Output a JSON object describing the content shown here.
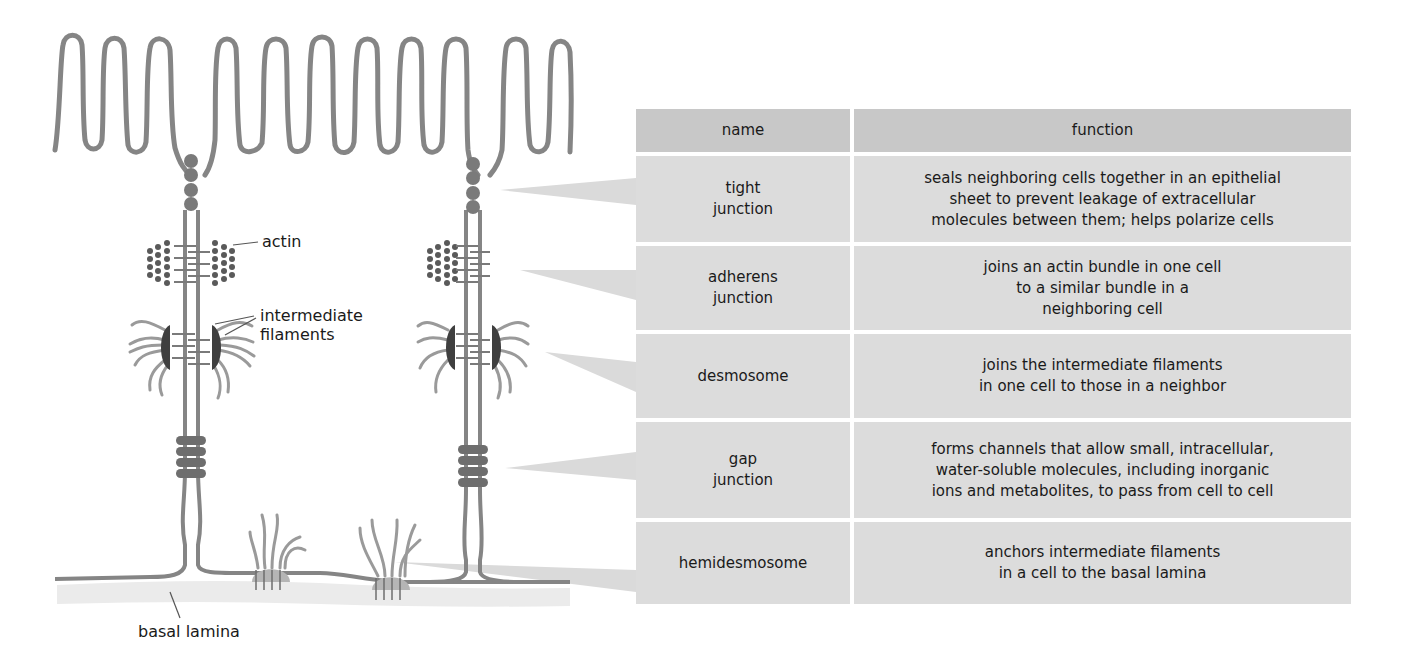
{
  "diagram": {
    "labels": {
      "actin": "actin",
      "intermediate_filaments": "intermediate\nfilaments",
      "basal_lamina": "basal lamina"
    },
    "colors": {
      "membrane": "#858585",
      "junction_dark": "#6e6e6e",
      "plaque": "#3e3e3e",
      "filament": "#9a9a9a",
      "basal_lamina": "#ececec",
      "pointer": "#d9d9d9"
    }
  },
  "table": {
    "headers": {
      "name": "name",
      "function": "function"
    },
    "rows": [
      {
        "name": "tight\njunction",
        "function": "seals neighboring cells together in an epithelial\nsheet to prevent leakage of extracellular\nmolecules between them; helps polarize cells",
        "height": 86
      },
      {
        "name": "adherens\njunction",
        "function": "joins an actin bundle in one cell\nto a similar bundle in a\nneighboring cell",
        "height": 84
      },
      {
        "name": "desmosome",
        "function": "joins the intermediate filaments\nin one cell to those in a neighbor",
        "height": 84
      },
      {
        "name": "gap\njunction",
        "function": "forms channels that allow small, intracellular,\nwater-soluble molecules, including inorganic\nions and metabolites, to pass from cell to cell",
        "height": 96
      },
      {
        "name": "hemidesmosome",
        "function": "anchors intermediate filaments\nin a cell to the basal lamina",
        "height": 82
      }
    ]
  }
}
